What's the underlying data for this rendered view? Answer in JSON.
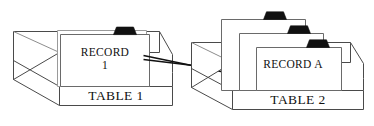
{
  "diagram": {
    "type": "illustration",
    "background_color": "#ffffff",
    "line_color": "#4a4a4a",
    "tab_color": "#111111",
    "connector_color": "#111111",
    "groups": [
      {
        "id": "left-group",
        "box_label": "TABLE 1",
        "cards": [
          {
            "id": "left-card-back",
            "label": "",
            "has_tab": false,
            "visible_text": false
          },
          {
            "id": "left-card-front",
            "label_line_1": "RECORD",
            "label_line_2": "1",
            "has_tab": true,
            "visible_text": true
          }
        ]
      },
      {
        "id": "right-group",
        "box_label": "TABLE 2",
        "cards": [
          {
            "id": "right-card-back",
            "label": "",
            "has_tab": true,
            "visible_text": false
          },
          {
            "id": "right-card-middle",
            "label": "",
            "has_tab": true,
            "visible_text": false
          },
          {
            "id": "right-card-front",
            "label_line_1": "RECORD A",
            "has_tab": true,
            "visible_text": true
          }
        ]
      }
    ],
    "connector": {
      "id": "record-link",
      "from": "RECORD 1",
      "to": "RECORD A",
      "style": "two-line-wedge"
    }
  },
  "labels": {
    "table_1": "TABLE 1",
    "table_2": "TABLE 2",
    "record_1_line_1": "RECORD",
    "record_1_line_2": "1",
    "record_a": "RECORD A"
  }
}
